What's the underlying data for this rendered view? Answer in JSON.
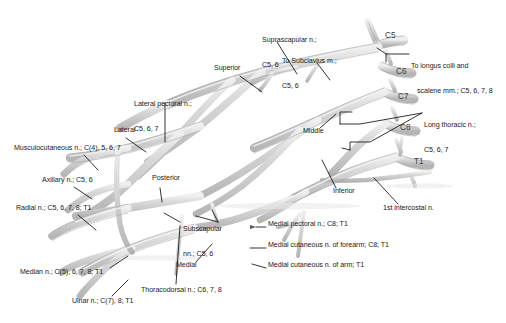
{
  "figure": {
    "colors": {
      "nerve_fill": "#cfcfcf",
      "nerve_fill_light": "#e2e2e2",
      "nerve_stroke": "#8d8d8d",
      "leader_line": "#111111",
      "text": "#1a1a1a",
      "root_text": "#3a3a3a",
      "background": "#ffffff"
    },
    "roots": [
      {
        "id": "c5",
        "label": "C5",
        "x": 385,
        "y": 36
      },
      {
        "id": "c6",
        "label": "C6",
        "x": 396,
        "y": 72
      },
      {
        "id": "c7",
        "label": "C7",
        "x": 398,
        "y": 97
      },
      {
        "id": "c8",
        "label": "C8",
        "x": 400,
        "y": 128
      },
      {
        "id": "t1",
        "label": "T1",
        "x": 414,
        "y": 162
      }
    ],
    "trunks": [
      {
        "id": "superior",
        "label": "Superior",
        "x": 214,
        "y": 68
      },
      {
        "id": "middle",
        "label": "Middle",
        "x": 303,
        "y": 131
      },
      {
        "id": "inferior",
        "label": "Inferior",
        "x": 333,
        "y": 191
      }
    ],
    "cords": [
      {
        "id": "lateral",
        "label": "Lateral",
        "x": 114,
        "y": 130
      },
      {
        "id": "posterior",
        "label": "Posterior",
        "x": 152,
        "y": 178
      },
      {
        "id": "medial",
        "label": "Medial",
        "x": 176,
        "y": 265
      }
    ],
    "branches": [
      {
        "id": "suprascapular",
        "lines": [
          "Suprascapular n.;",
          "C5, 6"
        ],
        "x": 262,
        "y": 23
      },
      {
        "id": "to-subclavius",
        "lines": [
          "To Subclavius m.;",
          "C5, 6"
        ],
        "x": 282,
        "y": 44
      },
      {
        "id": "to-longus-colli",
        "lines": [
          "To longus colli and",
          "scalene mm.; C5, 6, 7, 8"
        ],
        "x": 411,
        "y": 49
      },
      {
        "id": "long-thoracic",
        "lines": [
          "Long thoracic n.;",
          "C5, 6, 7"
        ],
        "x": 424,
        "y": 108
      },
      {
        "id": "lateral-pectoral",
        "lines": [
          "Lateral pectoral n.;",
          "C5, 6, 7"
        ],
        "x": 134,
        "y": 87
      },
      {
        "id": "musculocutaneous",
        "lines": [
          "Musculocutaneous n.; C(4), 5, 6, 7"
        ],
        "x": 14,
        "y": 148
      },
      {
        "id": "axillary",
        "lines": [
          "Axillary n.; C5, 6"
        ],
        "x": 42,
        "y": 180
      },
      {
        "id": "radial",
        "lines": [
          "Radial n.; C5, 6, 7, 8; T1"
        ],
        "x": 16,
        "y": 208
      },
      {
        "id": "subscapular",
        "lines": [
          "Subscapular",
          "nn.; C5, 6"
        ],
        "x": 183,
        "y": 212
      },
      {
        "id": "median",
        "lines": [
          "Median n.; C(5), 6, 7, 8; T1"
        ],
        "x": 20,
        "y": 272
      },
      {
        "id": "ulnar",
        "lines": [
          "Ulnar n.; C(7), 8; T1"
        ],
        "x": 72,
        "y": 301
      },
      {
        "id": "thoracodorsal",
        "lines": [
          "Thoracodorsal n.; C6, 7, 8"
        ],
        "x": 141,
        "y": 290
      },
      {
        "id": "medial-pectoral",
        "lines": [
          "Medial pectoral n.; C8; T1"
        ],
        "x": 268,
        "y": 224
      },
      {
        "id": "medial-cutaneous-forearm",
        "lines": [
          "Medial cutaneous n. of forearm; C8; T1"
        ],
        "x": 268,
        "y": 245
      },
      {
        "id": "medial-cutaneous-arm",
        "lines": [
          "Medial cutaneous n. of arm; T1"
        ],
        "x": 268,
        "y": 265
      },
      {
        "id": "first-intercostal",
        "lines": [
          "1st intercostal n."
        ],
        "x": 383,
        "y": 208
      }
    ]
  }
}
